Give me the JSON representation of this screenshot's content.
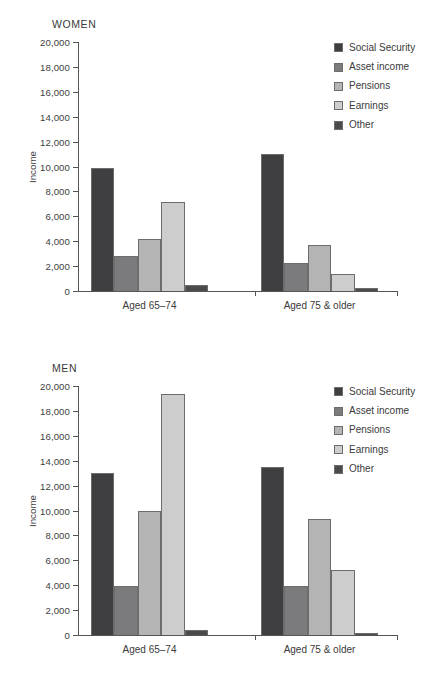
{
  "chart_data": [
    {
      "type": "bar",
      "title": "WOMEN",
      "xlabel": "",
      "ylabel": "Income",
      "ylim": [
        0,
        20000
      ],
      "ytick_labels": [
        "0",
        "2,000",
        "4,000",
        "6,000",
        "8,000",
        "10,000",
        "12,000",
        "14,000",
        "16,000",
        "18,000",
        "20,000"
      ],
      "yticks": [
        0,
        2000,
        4000,
        6000,
        8000,
        10000,
        12000,
        14000,
        16000,
        18000,
        20000
      ],
      "grid": false,
      "legend_position": "right",
      "categories": [
        "Aged 65–74",
        "Aged 75 & older"
      ],
      "series": [
        {
          "name": "Social Security",
          "color": "#3f3f42",
          "values": [
            9900,
            11000
          ]
        },
        {
          "name": "Asset income",
          "color": "#7b7b7e",
          "values": [
            2800,
            2250
          ]
        },
        {
          "name": "Pensions",
          "color": "#b4b4b4",
          "values": [
            4150,
            3700
          ]
        },
        {
          "name": "Earnings",
          "color": "#cdcdcd",
          "values": [
            7150,
            1400
          ]
        },
        {
          "name": "Other",
          "color": "#4b4b4e",
          "values": [
            450,
            250
          ]
        }
      ]
    },
    {
      "type": "bar",
      "title": "MEN",
      "xlabel": "",
      "ylabel": "Income",
      "ylim": [
        0,
        20000
      ],
      "ytick_labels": [
        "0",
        "2,000",
        "4,000",
        "6,000",
        "8,000",
        "10,000",
        "12,000",
        "14,000",
        "16,000",
        "18,000",
        "20,000"
      ],
      "yticks": [
        0,
        2000,
        4000,
        6000,
        8000,
        10000,
        12000,
        14000,
        16000,
        18000,
        20000
      ],
      "grid": false,
      "legend_position": "right",
      "categories": [
        "Aged 65–74",
        "Aged 75 & older"
      ],
      "series": [
        {
          "name": "Social Security",
          "color": "#3f3f42",
          "values": [
            13000,
            13500
          ]
        },
        {
          "name": "Asset income",
          "color": "#7b7b7e",
          "values": [
            3900,
            3900
          ]
        },
        {
          "name": "Pensions",
          "color": "#b4b4b4",
          "values": [
            10000,
            9350
          ]
        },
        {
          "name": "Earnings",
          "color": "#cdcdcd",
          "values": [
            19350,
            5200
          ]
        },
        {
          "name": "Other",
          "color": "#4b4b4e",
          "values": [
            400,
            200
          ]
        }
      ]
    }
  ],
  "panels": [
    {
      "id": "women",
      "title": "WOMEN",
      "axis_title": "Income",
      "categories": [
        "Aged 65–74",
        "Aged 75 & older"
      ],
      "legend": [
        {
          "label": "Social Security",
          "color": "#3f3f42"
        },
        {
          "label": "Asset income",
          "color": "#7b7b7e"
        },
        {
          "label": "Pensions",
          "color": "#b4b4b4"
        },
        {
          "label": "Earnings",
          "color": "#cdcdcd"
        },
        {
          "label": "Other",
          "color": "#4b4b4e"
        }
      ]
    },
    {
      "id": "men",
      "title": "MEN",
      "axis_title": "Income",
      "categories": [
        "Aged 65–74",
        "Aged 75 & older"
      ],
      "legend": [
        {
          "label": "Social Security",
          "color": "#3f3f42"
        },
        {
          "label": "Asset income",
          "color": "#7b7b7e"
        },
        {
          "label": "Pensions",
          "color": "#b4b4b4"
        },
        {
          "label": "Earnings",
          "color": "#cdcdcd"
        },
        {
          "label": "Other",
          "color": "#4b4b4e"
        }
      ]
    }
  ]
}
